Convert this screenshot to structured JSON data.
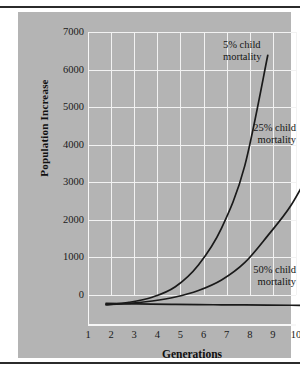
{
  "figure": {
    "background": "#b4b4b4",
    "gridline_color": "#f2f2f2",
    "curve_color": "#1a1a1a",
    "rule_color": "#2b2b2b"
  },
  "chart_data": {
    "type": "line",
    "title": "",
    "xlabel": "Generations",
    "ylabel": "Population Increase",
    "xlim": [
      1,
      10
    ],
    "ylim": [
      0,
      7000
    ],
    "xticks": [
      1,
      2,
      3,
      4,
      5,
      6,
      7,
      8,
      9,
      10
    ],
    "yticks": [
      0,
      1000,
      2000,
      3000,
      4000,
      5000,
      6000,
      7000
    ],
    "grid": true,
    "legend_position": "inline-annotations",
    "x": [
      1,
      2,
      3,
      4,
      5,
      6,
      7,
      8,
      9,
      10
    ],
    "series": [
      {
        "name": "5% child mortality",
        "annotation": "5% child\nmortality",
        "values": [
          60,
          125,
          260,
          540,
          1120,
          2100,
          3750,
          6700,
          null,
          null
        ]
      },
      {
        "name": "25% child mortality",
        "annotation": "25% child\nmortality",
        "values": [
          60,
          95,
          160,
          265,
          440,
          720,
          1180,
          1900,
          2700,
          3800
        ]
      },
      {
        "name": "50% child mortality",
        "annotation": "50% child\nmortality",
        "values": [
          95,
          85,
          75,
          68,
          62,
          58,
          54,
          50,
          46,
          42
        ]
      }
    ]
  },
  "axes": {
    "ytick_labels": [
      "7000",
      "6000",
      "5000",
      "4000",
      "3000",
      "2000",
      "1000",
      "0"
    ],
    "xtick_labels": [
      "1",
      "2",
      "3",
      "4",
      "5",
      "6",
      "7",
      "8",
      "9",
      "10"
    ],
    "ylabel_text": "Population Increase",
    "xlabel_text": "Generations"
  },
  "annotations": [
    {
      "id": "annot-5",
      "text": "5% child\nmortality"
    },
    {
      "id": "annot-25",
      "text": "25% child\nmortality"
    },
    {
      "id": "annot-50",
      "text": "50% child\nmortality"
    }
  ]
}
